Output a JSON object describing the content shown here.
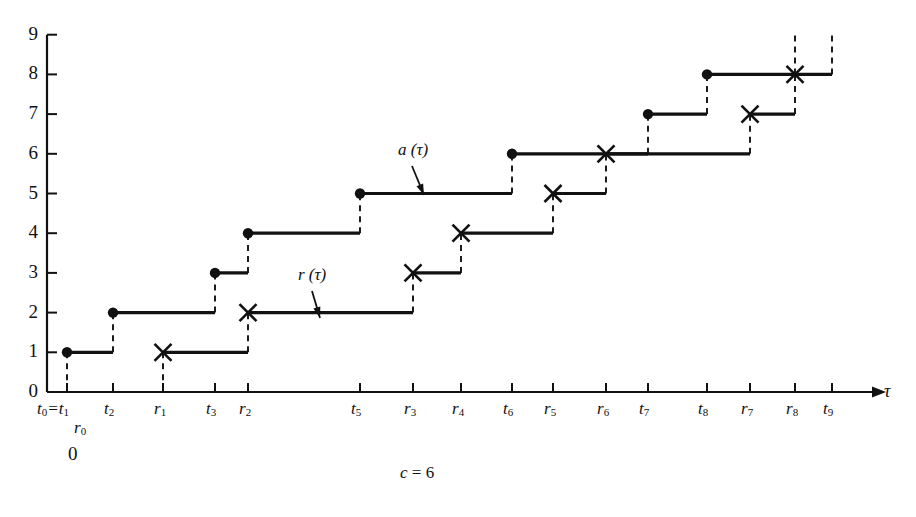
{
  "chart_data": {
    "type": "line",
    "title": "",
    "subtitle": "",
    "caption": "c = 6",
    "caption_var": "c",
    "caption_eq": "=",
    "caption_val": "6",
    "xlabel": "τ",
    "ylabel": "",
    "ylim": [
      0,
      9
    ],
    "grid": false,
    "legend_position": "inline-annotation",
    "y_ticks": [
      "0",
      "1",
      "2",
      "3",
      "4",
      "5",
      "6",
      "7",
      "8",
      "9"
    ],
    "x_tick_labels": [
      {
        "id": "t0t1",
        "base": "t",
        "sub": "0",
        "text": "t0=t1",
        "second_base": "t",
        "second_sub": "1",
        "x": 67
      },
      {
        "id": "t2",
        "base": "t",
        "sub": "2",
        "text": "t2",
        "x": 113
      },
      {
        "id": "r1",
        "base": "r",
        "sub": "1",
        "text": "r1",
        "x": 163
      },
      {
        "id": "t3",
        "base": "t",
        "sub": "3",
        "text": "t3",
        "x": 215
      },
      {
        "id": "r2",
        "base": "r",
        "sub": "2",
        "text": "r2",
        "x": 248
      },
      {
        "id": "t5",
        "base": "t",
        "sub": "5",
        "text": "t5",
        "x": 360
      },
      {
        "id": "r3",
        "base": "r",
        "sub": "3",
        "text": "r3",
        "x": 413
      },
      {
        "id": "r4",
        "base": "r",
        "sub": "4",
        "text": "r4",
        "x": 461
      },
      {
        "id": "t6",
        "base": "t",
        "sub": "6",
        "text": "t6",
        "x": 512
      },
      {
        "id": "r5",
        "base": "r",
        "sub": "5",
        "text": "r5",
        "x": 553
      },
      {
        "id": "r6",
        "base": "r",
        "sub": "6",
        "text": "r6",
        "x": 606
      },
      {
        "id": "t7",
        "base": "t",
        "sub": "7",
        "text": "t7",
        "x": 648
      },
      {
        "id": "t8",
        "base": "t",
        "sub": "8",
        "text": "t8",
        "x": 707
      },
      {
        "id": "r7",
        "base": "r",
        "sub": "7",
        "text": "r7",
        "x": 750
      },
      {
        "id": "r8",
        "base": "r",
        "sub": "8",
        "text": "r8",
        "x": 795
      },
      {
        "id": "t9",
        "base": "t",
        "sub": "9",
        "text": "t9",
        "x": 832
      }
    ],
    "origin_labels": {
      "r0": "r0",
      "r0_base": "r",
      "r0_sub": "0",
      "zero": "0"
    },
    "series": [
      {
        "name": "a (τ)",
        "label_base": "a",
        "label_arg": "(τ)",
        "marker": "filled-circle",
        "step_points": [
          {
            "x": 67,
            "y": 1
          },
          {
            "x": 113,
            "y": 2
          },
          {
            "x": 215,
            "y": 3
          },
          {
            "x": 248,
            "y": 4
          },
          {
            "x": 360,
            "y": 5
          },
          {
            "x": 512,
            "y": 6
          },
          {
            "x": 648,
            "y": 7
          },
          {
            "x": 707,
            "y": 8
          }
        ],
        "end_x": 795
      },
      {
        "name": "r (τ)",
        "label_base": "r",
        "label_arg": "(τ)",
        "marker": "cross",
        "step_points": [
          {
            "x": 163,
            "y": 1
          },
          {
            "x": 248,
            "y": 2
          },
          {
            "x": 413,
            "y": 3
          },
          {
            "x": 461,
            "y": 4
          },
          {
            "x": 553,
            "y": 5
          },
          {
            "x": 606,
            "y": 6
          },
          {
            "x": 750,
            "y": 7
          },
          {
            "x": 795,
            "y": 8
          }
        ],
        "end_x": 832
      }
    ],
    "annotations": [
      {
        "id": "a-label",
        "text": "a (τ)",
        "x": 398,
        "y": 140,
        "arrow_to_x": 424,
        "arrow_to_y": 195
      },
      {
        "id": "r-label",
        "text": "r (τ)",
        "x": 298,
        "y": 265,
        "arrow_to_x": 320,
        "arrow_to_y": 318
      }
    ]
  },
  "colors": {
    "ink": "#111111",
    "background": "#ffffff"
  }
}
